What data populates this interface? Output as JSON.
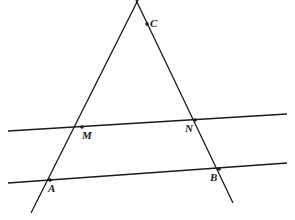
{
  "diagram": {
    "type": "geometry",
    "points": [
      {
        "id": "C",
        "label": "C",
        "x": 147,
        "y": 24,
        "label_dx": 3,
        "label_dy": 3
      },
      {
        "id": "M",
        "label": "M",
        "x": 82,
        "y": 127,
        "label_dx": 0,
        "label_dy": 12
      },
      {
        "id": "N",
        "label": "N",
        "x": 195,
        "y": 120,
        "label_dx": -10,
        "label_dy": 12
      },
      {
        "id": "A",
        "label": "A",
        "x": 50,
        "y": 180,
        "label_dx": -2,
        "label_dy": 12
      },
      {
        "id": "B",
        "label": "B",
        "x": 219,
        "y": 169,
        "label_dx": -9,
        "label_dy": 12
      }
    ],
    "lines": [
      {
        "id": "line-CA",
        "name": "line-through-c-m-a",
        "x1": 138,
        "y1": 0,
        "x2": 31,
        "y2": 213
      },
      {
        "id": "line-CB",
        "name": "line-through-c-n-b",
        "x1": 136,
        "y1": 0,
        "x2": 233,
        "y2": 203
      },
      {
        "id": "line-MN",
        "name": "line-through-m-n",
        "x1": 8,
        "y1": 131,
        "x2": 287,
        "y2": 114
      },
      {
        "id": "line-AB",
        "name": "line-through-a-b",
        "x1": 8,
        "y1": 183,
        "x2": 287,
        "y2": 163
      }
    ],
    "labels": {
      "C": "C",
      "M": "M",
      "N": "N",
      "A": "A",
      "B": "B"
    },
    "colors": {
      "stroke": "#1a1a1a",
      "background": "#ffffff"
    }
  }
}
